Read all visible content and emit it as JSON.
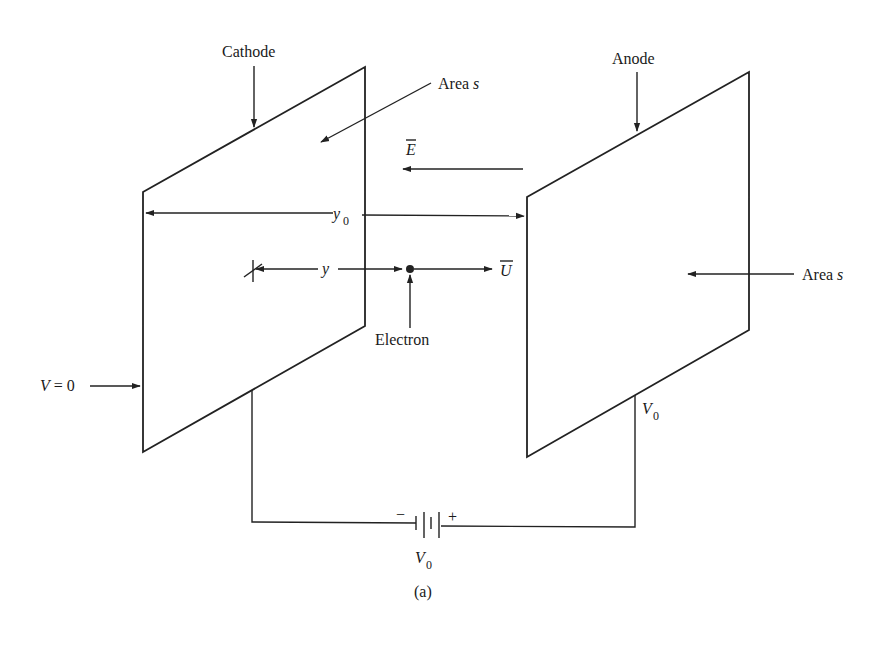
{
  "figure": {
    "caption": "(a)",
    "labels": {
      "cathode": "Cathode",
      "anode": "Anode",
      "area_cathode_prefix": "Area ",
      "area_cathode_var": "s",
      "area_anode_prefix": "Area ",
      "area_anode_var": "s",
      "field": "E",
      "separation": "y",
      "separation_sub": "0",
      "position": "y",
      "velocity": "U",
      "electron": "Electron",
      "cathode_potential_var": "V",
      "cathode_potential_rest": " = 0",
      "anode_potential_var": "V",
      "anode_potential_sub": "0",
      "battery_var": "V",
      "battery_sub": "0",
      "battery_minus": "−",
      "battery_plus": "+"
    },
    "colors": {
      "ink": "#222222",
      "background": "#ffffff"
    }
  }
}
